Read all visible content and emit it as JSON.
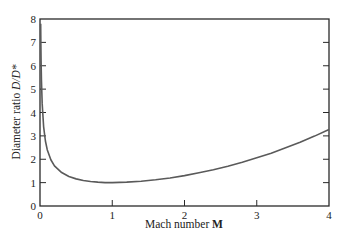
{
  "chart_data": {
    "type": "line",
    "title": "",
    "xlabel": "Mach number M",
    "ylabel": "Diameter ratio D/D*",
    "xlim": [
      0,
      4
    ],
    "ylim": [
      0,
      8
    ],
    "xticks": [
      0,
      1,
      2,
      3,
      4
    ],
    "yticks": [
      0,
      1,
      2,
      3,
      4,
      5,
      6,
      7,
      8
    ],
    "grid": false,
    "legend": null,
    "series": [
      {
        "name": "D/D*",
        "x": [
          0.0095,
          0.01,
          0.012,
          0.015,
          0.02,
          0.03,
          0.05,
          0.075,
          0.1,
          0.15,
          0.2,
          0.3,
          0.4,
          0.5,
          0.6,
          0.7,
          0.8,
          0.9,
          1.0,
          1.2,
          1.4,
          1.6,
          1.8,
          2.0,
          2.2,
          2.4,
          2.6,
          2.8,
          3.0,
          3.2,
          3.4,
          3.6,
          3.8,
          4.0
        ],
        "y": [
          7.8,
          7.61,
          6.94,
          6.21,
          5.38,
          4.39,
          3.4,
          2.78,
          2.41,
          1.98,
          1.72,
          1.43,
          1.26,
          1.16,
          1.09,
          1.05,
          1.02,
          1.0,
          1.0,
          1.02,
          1.06,
          1.12,
          1.2,
          1.3,
          1.42,
          1.55,
          1.7,
          1.87,
          2.06,
          2.26,
          2.49,
          2.73,
          2.99,
          3.27
        ]
      }
    ]
  },
  "labels": {
    "x_prefix": "Mach number ",
    "x_symbol": "M",
    "y_prefix": "Diameter ratio ",
    "y_symbol": "D/D*"
  },
  "colors": {
    "axis": "#2a2a2a",
    "curve": "#5a5a5a",
    "background": "#ffffff"
  }
}
